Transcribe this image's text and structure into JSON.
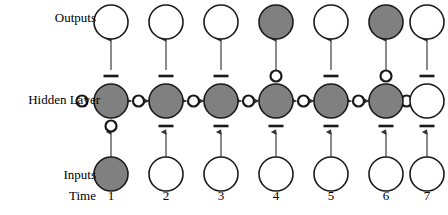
{
  "figure": {
    "row_labels": {
      "outputs": "Outputs",
      "hidden": "Hidden Layer",
      "inputs": "Inputs",
      "time": "Time"
    },
    "colors": {
      "node_fill_active": "#808080",
      "node_fill_inactive": "#ffffff",
      "node_stroke": "#1a1a1a",
      "arrow": "#4d4d4d",
      "gate_marker": "#1a1a1a",
      "background": "#ffffff",
      "text": "#000000"
    },
    "geometry": {
      "column_x": [
        111,
        166,
        221,
        276,
        331,
        386,
        427
      ],
      "output_y": 22,
      "hidden_y": 101,
      "input_y": 174,
      "node_r_output": 17,
      "node_r_hidden": 17,
      "node_r_input": 17,
      "gate_r": 5.5,
      "gate_bar_w": 15,
      "recurrent_gate_x_offset": -28
    }
  },
  "timesteps": [
    {
      "time_label": "1",
      "input_node": {
        "name": "input-node",
        "state": "active",
        "fill": "#808080"
      },
      "hidden_node": {
        "name": "hidden-node",
        "state": "active",
        "fill": "#808080"
      },
      "output_node": {
        "name": "output-node",
        "state": "inactive",
        "fill": "#ffffff"
      },
      "input_gate": {
        "name": "input-gate",
        "symbol": "open-circle",
        "state": "open"
      },
      "output_gate": {
        "name": "output-gate",
        "symbol": "bar",
        "state": "closed"
      },
      "forget_gate": {
        "name": "forget-gate",
        "symbol": "open-circle",
        "state": "open"
      }
    },
    {
      "time_label": "2",
      "input_node": {
        "name": "input-node",
        "state": "inactive",
        "fill": "#ffffff"
      },
      "hidden_node": {
        "name": "hidden-node",
        "state": "active",
        "fill": "#808080"
      },
      "output_node": {
        "name": "output-node",
        "state": "inactive",
        "fill": "#ffffff"
      },
      "input_gate": {
        "name": "input-gate",
        "symbol": "bar",
        "state": "closed"
      },
      "output_gate": {
        "name": "output-gate",
        "symbol": "bar",
        "state": "closed"
      },
      "forget_gate": {
        "name": "forget-gate",
        "symbol": "open-circle",
        "state": "open"
      }
    },
    {
      "time_label": "3",
      "input_node": {
        "name": "input-node",
        "state": "inactive",
        "fill": "#ffffff"
      },
      "hidden_node": {
        "name": "hidden-node",
        "state": "active",
        "fill": "#808080"
      },
      "output_node": {
        "name": "output-node",
        "state": "inactive",
        "fill": "#ffffff"
      },
      "input_gate": {
        "name": "input-gate",
        "symbol": "bar",
        "state": "closed"
      },
      "output_gate": {
        "name": "output-gate",
        "symbol": "bar",
        "state": "closed"
      },
      "forget_gate": {
        "name": "forget-gate",
        "symbol": "open-circle",
        "state": "open"
      }
    },
    {
      "time_label": "4",
      "input_node": {
        "name": "input-node",
        "state": "inactive",
        "fill": "#ffffff"
      },
      "hidden_node": {
        "name": "hidden-node",
        "state": "active",
        "fill": "#808080"
      },
      "output_node": {
        "name": "output-node",
        "state": "active",
        "fill": "#808080"
      },
      "input_gate": {
        "name": "input-gate",
        "symbol": "bar",
        "state": "closed"
      },
      "output_gate": {
        "name": "output-gate",
        "symbol": "open-circle",
        "state": "open"
      },
      "forget_gate": {
        "name": "forget-gate",
        "symbol": "open-circle",
        "state": "open"
      }
    },
    {
      "time_label": "5",
      "input_node": {
        "name": "input-node",
        "state": "inactive",
        "fill": "#ffffff"
      },
      "hidden_node": {
        "name": "hidden-node",
        "state": "active",
        "fill": "#808080"
      },
      "output_node": {
        "name": "output-node",
        "state": "inactive",
        "fill": "#ffffff"
      },
      "input_gate": {
        "name": "input-gate",
        "symbol": "bar",
        "state": "closed"
      },
      "output_gate": {
        "name": "output-gate",
        "symbol": "bar",
        "state": "closed"
      },
      "forget_gate": {
        "name": "forget-gate",
        "symbol": "open-circle",
        "state": "open"
      }
    },
    {
      "time_label": "6",
      "input_node": {
        "name": "input-node",
        "state": "inactive",
        "fill": "#ffffff"
      },
      "hidden_node": {
        "name": "hidden-node",
        "state": "active",
        "fill": "#808080"
      },
      "output_node": {
        "name": "output-node",
        "state": "active",
        "fill": "#808080"
      },
      "input_gate": {
        "name": "input-gate",
        "symbol": "bar",
        "state": "closed"
      },
      "output_gate": {
        "name": "output-gate",
        "symbol": "open-circle",
        "state": "open"
      },
      "forget_gate": {
        "name": "forget-gate",
        "symbol": "open-circle",
        "state": "open"
      }
    },
    {
      "time_label": "7",
      "input_node": {
        "name": "input-node",
        "state": "inactive",
        "fill": "#ffffff"
      },
      "hidden_node": {
        "name": "hidden-node",
        "state": "inactive",
        "fill": "#ffffff"
      },
      "output_node": {
        "name": "output-node",
        "state": "inactive",
        "fill": "#ffffff"
      },
      "input_gate": {
        "name": "input-gate",
        "symbol": "bar",
        "state": "closed"
      },
      "output_gate": {
        "name": "output-gate",
        "symbol": "bar",
        "state": "closed"
      },
      "forget_gate": {
        "name": "forget-gate",
        "symbol": "open-circle",
        "state": "open"
      }
    }
  ]
}
